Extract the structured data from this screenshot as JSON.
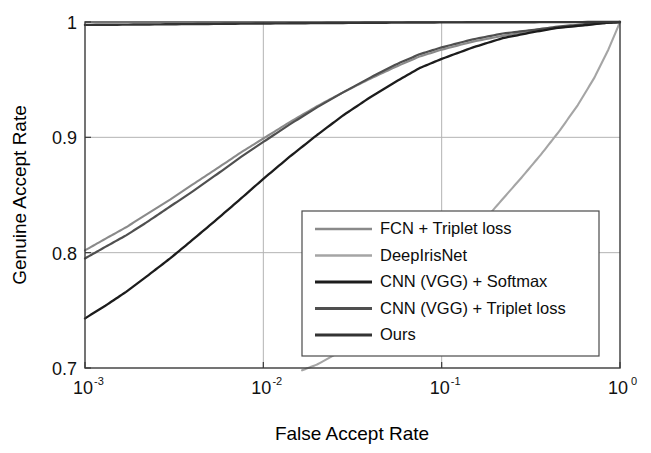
{
  "chart_data": {
    "type": "line",
    "title": "",
    "xlabel": "False Accept Rate",
    "ylabel": "Genuine Accept Rate",
    "xscale": "log",
    "yscale": "linear",
    "xlim": [
      0.001,
      1
    ],
    "ylim": [
      0.7,
      1.0
    ],
    "grid": true,
    "legend_position": "lower right",
    "xtick_labels": [
      "10-3",
      "10-2",
      "10-1",
      "100"
    ],
    "xtick_mantissas": [
      "10",
      "10",
      "10",
      "10"
    ],
    "xtick_exponents": [
      "-3",
      "-2",
      "-1",
      "0"
    ],
    "xtick_values": [
      0.001,
      0.01,
      0.1,
      1
    ],
    "ytick_labels": [
      "0.7",
      "0.8",
      "0.9",
      "1"
    ],
    "ytick_values": [
      0.7,
      0.8,
      0.9,
      1.0
    ],
    "series": [
      {
        "name": "FCN + Triplet loss",
        "color": "#8a8a8a",
        "width": 2.1,
        "x": [
          0.001,
          0.0013,
          0.0017,
          0.0022,
          0.003,
          0.004,
          0.0055,
          0.0075,
          0.01,
          0.014,
          0.02,
          0.028,
          0.04,
          0.055,
          0.075,
          0.1,
          0.15,
          0.22,
          0.32,
          0.45,
          0.62,
          0.8,
          1.0
        ],
        "y": [
          0.802,
          0.812,
          0.822,
          0.833,
          0.846,
          0.859,
          0.873,
          0.887,
          0.899,
          0.913,
          0.927,
          0.939,
          0.951,
          0.961,
          0.97,
          0.976,
          0.983,
          0.988,
          0.992,
          0.995,
          0.997,
          0.999,
          1.0
        ]
      },
      {
        "name": "DeepIrisNet",
        "color": "#a5a5a5",
        "width": 2.1,
        "x": [
          0.0165,
          0.02,
          0.03,
          0.045,
          0.065,
          0.09,
          0.12,
          0.16,
          0.21,
          0.28,
          0.36,
          0.46,
          0.58,
          0.72,
          0.86,
          1.0
        ],
        "y": [
          0.698,
          0.703,
          0.718,
          0.737,
          0.759,
          0.781,
          0.801,
          0.822,
          0.843,
          0.865,
          0.885,
          0.906,
          0.928,
          0.952,
          0.976,
          1.0
        ]
      },
      {
        "name": "CNN (VGG) + Softmax",
        "color": "#1c1c1c",
        "width": 2.3,
        "x": [
          0.001,
          0.0013,
          0.0017,
          0.0022,
          0.003,
          0.004,
          0.0055,
          0.0075,
          0.01,
          0.014,
          0.02,
          0.028,
          0.04,
          0.055,
          0.075,
          0.1,
          0.15,
          0.22,
          0.32,
          0.45,
          0.62,
          0.8,
          1.0
        ],
        "y": [
          0.743,
          0.754,
          0.766,
          0.779,
          0.795,
          0.811,
          0.829,
          0.847,
          0.864,
          0.883,
          0.902,
          0.919,
          0.935,
          0.948,
          0.96,
          0.968,
          0.978,
          0.986,
          0.991,
          0.995,
          0.997,
          0.999,
          1.0
        ]
      },
      {
        "name": "CNN (VGG) + Triplet loss",
        "color": "#4f4f4f",
        "width": 2.2,
        "x": [
          0.001,
          0.0013,
          0.0017,
          0.0022,
          0.003,
          0.004,
          0.0055,
          0.0075,
          0.01,
          0.014,
          0.02,
          0.028,
          0.04,
          0.055,
          0.075,
          0.1,
          0.15,
          0.22,
          0.32,
          0.45,
          0.62,
          0.8,
          1.0
        ],
        "y": [
          0.795,
          0.805,
          0.815,
          0.826,
          0.84,
          0.853,
          0.868,
          0.883,
          0.896,
          0.911,
          0.926,
          0.939,
          0.952,
          0.963,
          0.972,
          0.978,
          0.985,
          0.99,
          0.993,
          0.996,
          0.998,
          0.999,
          1.0
        ]
      },
      {
        "name": "Ours",
        "color": "#333333",
        "width": 2.4,
        "x": [
          0.001,
          0.002,
          0.004,
          0.008,
          0.015,
          0.03,
          0.06,
          0.12,
          0.25,
          0.5,
          1.0
        ],
        "y": [
          0.9975,
          0.9978,
          0.9982,
          0.9986,
          0.9989,
          0.9992,
          0.9995,
          0.9997,
          0.9998,
          0.9999,
          1.0
        ]
      }
    ]
  },
  "legend": {
    "entries": [
      {
        "label": "FCN + Triplet loss"
      },
      {
        "label": "DeepIrisNet"
      },
      {
        "label": "CNN (VGG) + Softmax"
      },
      {
        "label": "CNN (VGG) + Triplet loss"
      },
      {
        "label": "Ours"
      }
    ]
  }
}
